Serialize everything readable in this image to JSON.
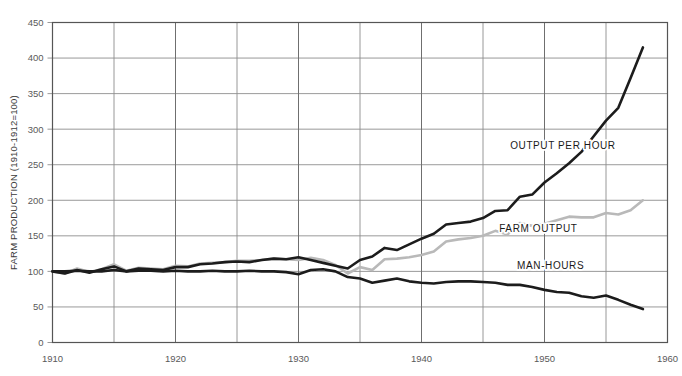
{
  "chart_data": {
    "type": "line",
    "title": "",
    "subtitle": "",
    "xlabel": "",
    "ylabel": "FARM PRODUCTION (1910-1912=100)",
    "xlim": [
      1910,
      1960
    ],
    "ylim": [
      0,
      450
    ],
    "grid": true,
    "legend_position": "inline-right",
    "x_tick_labels": [
      "1910",
      "1920",
      "1930",
      "1940",
      "1950",
      "1960"
    ],
    "x_tick_values": [
      1910,
      1920,
      1930,
      1940,
      1950,
      1960
    ],
    "x_minor_tick_values": [
      1915,
      1925,
      1935,
      1945,
      1955
    ],
    "y_tick_labels": [
      "0",
      "50",
      "100",
      "150",
      "200",
      "250",
      "300",
      "350",
      "400",
      "450"
    ],
    "y_tick_values": [
      0,
      50,
      100,
      150,
      200,
      250,
      300,
      350,
      400,
      450
    ],
    "x": [
      1910,
      1911,
      1912,
      1913,
      1914,
      1915,
      1916,
      1917,
      1918,
      1919,
      1920,
      1921,
      1922,
      1923,
      1924,
      1925,
      1926,
      1927,
      1928,
      1929,
      1930,
      1931,
      1932,
      1933,
      1934,
      1935,
      1936,
      1937,
      1938,
      1939,
      1940,
      1941,
      1942,
      1943,
      1944,
      1945,
      1946,
      1947,
      1948,
      1949,
      1950,
      1951,
      1952,
      1953,
      1954,
      1955,
      1956,
      1957,
      1958
    ],
    "series": [
      {
        "name": "OUTPUT PER HOUR",
        "color": "#1c1c1c",
        "width": 2.6,
        "label_x": 1951.5,
        "label_y": 272,
        "values": [
          100,
          97,
          102,
          98,
          103,
          107,
          100,
          104,
          103,
          102,
          106,
          106,
          110,
          111,
          113,
          114,
          113,
          116,
          118,
          117,
          120,
          116,
          112,
          108,
          104,
          116,
          121,
          133,
          130,
          138,
          146,
          153,
          166,
          168,
          170,
          175,
          185,
          186,
          205,
          208,
          225,
          238,
          252,
          268,
          290,
          312,
          330,
          372,
          415
        ]
      },
      {
        "name": "FARM OUTPUT",
        "color": "#b9b9b9",
        "width": 2.6,
        "label_x": 1949.5,
        "label_y": 155,
        "values": [
          100,
          97,
          104,
          99,
          103,
          110,
          101,
          105,
          104,
          103,
          108,
          107,
          111,
          112,
          113,
          115,
          115,
          116,
          118,
          117,
          116,
          119,
          116,
          109,
          97,
          106,
          102,
          117,
          118,
          120,
          123,
          128,
          142,
          145,
          147,
          150,
          157,
          152,
          168,
          164,
          167,
          172,
          177,
          176,
          176,
          182,
          180,
          186,
          200
        ]
      },
      {
        "name": "MAN-HOURS",
        "color": "#1c1c1c",
        "width": 2.6,
        "label_x": 1950.5,
        "label_y": 104,
        "values": [
          100,
          100,
          101,
          100,
          100,
          102,
          100,
          101,
          101,
          100,
          101,
          100,
          100,
          101,
          100,
          100,
          101,
          100,
          100,
          99,
          96,
          102,
          103,
          100,
          92,
          90,
          84,
          87,
          90,
          86,
          84,
          83,
          85,
          86,
          86,
          85,
          84,
          81,
          81,
          78,
          74,
          71,
          70,
          65,
          63,
          66,
          60,
          53,
          47
        ]
      }
    ]
  },
  "axis": {
    "y_title": "FARM PRODUCTION (1910-1912=100)"
  }
}
